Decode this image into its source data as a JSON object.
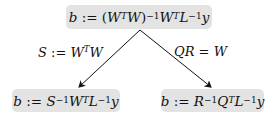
{
  "diagram": {
    "root": {
      "formula": "b := (W^T W)^{-1} W^T L^{-1} y",
      "parts": {
        "b": "b",
        "assign": " := ",
        "lp": "(",
        "W1": "W",
        "T1": "T",
        "W2": "W",
        "rp": ")",
        "inv1": "−1",
        "W3": "W",
        "T2": "T",
        "L": "L",
        "inv2": "−1",
        "y": "y"
      }
    },
    "edges": [
      {
        "label": "S := W^T W",
        "parts": {
          "S": "S",
          "assign": " := ",
          "W1": "W",
          "T": "T",
          "W2": "W"
        }
      },
      {
        "label": "QR = W",
        "parts": {
          "QR": "QR",
          "eq": " = ",
          "W": "W"
        }
      }
    ],
    "leaves": [
      {
        "formula": "b := S^{-1} W^T L^{-1} y",
        "parts": {
          "b": "b",
          "assign": " := ",
          "S": "S",
          "inv1": "−1",
          "W": "W",
          "T": "T",
          "L": "L",
          "inv2": "−1",
          "y": "y"
        }
      },
      {
        "formula": "b := R^{-1} Q^T L^{-1} y",
        "parts": {
          "b": "b",
          "assign": " := ",
          "R": "R",
          "inv1": "−1",
          "Q": "Q",
          "T": "T",
          "L": "L",
          "inv2": "−1",
          "y": "y"
        }
      }
    ],
    "colors": {
      "box_fill": "#e3e3e3",
      "line": "#111111",
      "text": "#111111"
    }
  }
}
